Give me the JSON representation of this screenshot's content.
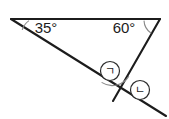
{
  "figure": {
    "background_color": "#ffffff",
    "line_color": "#1c1c1c",
    "arc_color": "#8a8a8a",
    "labels": {
      "left_angle": "35°",
      "right_angle": "60°",
      "mark_one": "ㄱ",
      "mark_two": "ㄴ"
    },
    "points": {
      "left_vertex": {
        "x": 11,
        "y": 19
      },
      "right_vertex": {
        "x": 160,
        "y": 19
      },
      "lower_vertex": {
        "x": 118,
        "y": 92
      },
      "ray_end_lower_right": {
        "x": 166,
        "y": 116
      }
    },
    "segments": [
      {
        "name": "top-edge",
        "from": "left_vertex",
        "to": "right_vertex"
      },
      {
        "name": "left-ray-through-lower-vertex",
        "from": "left_vertex",
        "to": "ray_end_lower_right"
      },
      {
        "name": "right-edge",
        "from": "right_vertex",
        "to": "lower_vertex"
      }
    ],
    "angle_marks": [
      {
        "name": "left-angle-arc",
        "vertex": "left_vertex",
        "value": "35°"
      },
      {
        "name": "right-angle-arc",
        "vertex": "right_vertex",
        "value": "60°"
      },
      {
        "name": "interior-angle-arc",
        "vertex": "lower_vertex",
        "value": "ㄱ"
      },
      {
        "name": "exterior-angle-mark",
        "vertex": "lower_vertex",
        "value": "ㄴ"
      }
    ],
    "label_positions": {
      "left_angle": {
        "x": 46,
        "y": 29
      },
      "right_angle": {
        "x": 124,
        "y": 29
      },
      "mark_one": {
        "x": 110,
        "y": 71
      },
      "mark_two": {
        "x": 140,
        "y": 90
      }
    }
  }
}
